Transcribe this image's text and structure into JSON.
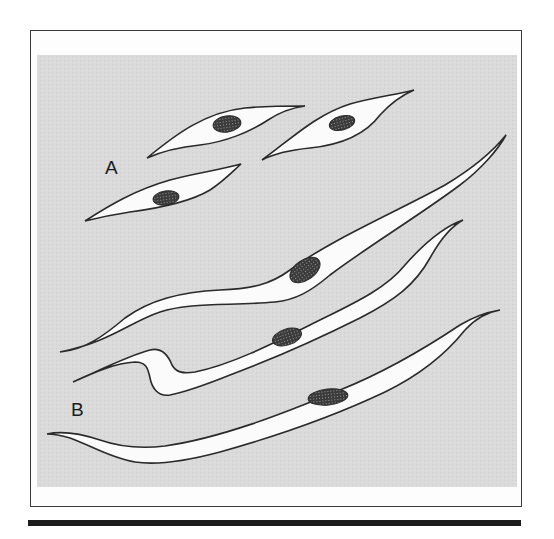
{
  "figure": {
    "background_color": "#d9d9d9",
    "cell_fill": "#fbfbfb",
    "outline_color": "#2a2a2a",
    "nucleus_color": "#3a3a3a",
    "groups": [
      {
        "label": "A",
        "description": "short spindle-shaped cells with central oval nuclei",
        "cell_count": 3
      },
      {
        "label": "B",
        "description": "elongated, wavy spindle cells with oval nuclei",
        "cell_count": 3
      }
    ]
  }
}
